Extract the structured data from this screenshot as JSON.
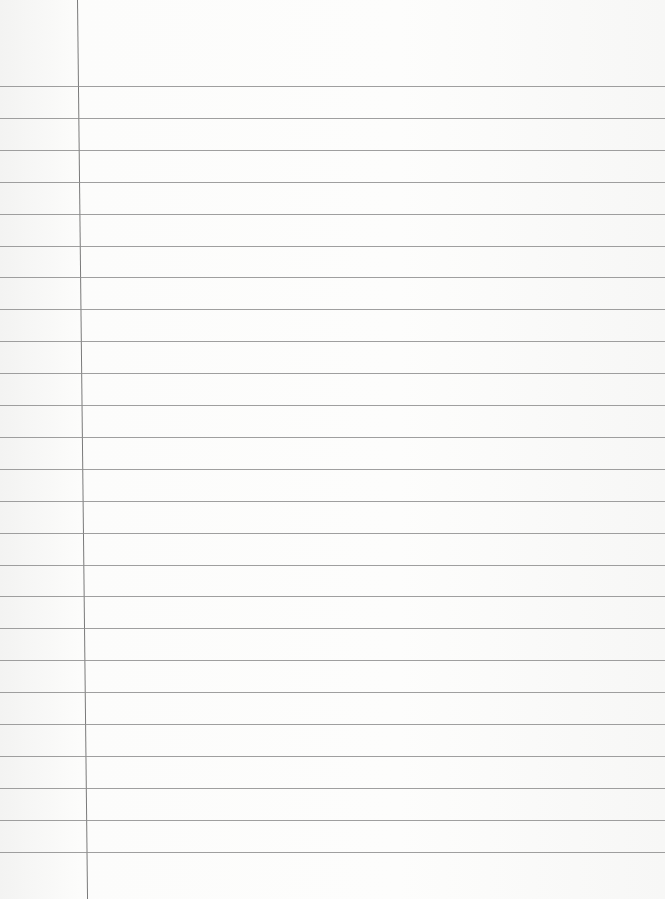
{
  "paper": {
    "type": "lined-paper",
    "background": "#fcfcfb",
    "rule_color": "#8e8e8e",
    "margin_color": "#7a7a7a",
    "rule_count": 25,
    "first_rule_y": 86,
    "rule_spacing": 31.9,
    "margin_x_top": 77,
    "margin_x_bottom": 87
  }
}
